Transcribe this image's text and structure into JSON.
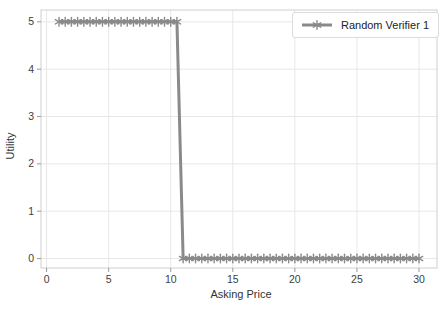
{
  "chart_data": {
    "type": "line",
    "title": "",
    "xlabel": "Asking Price",
    "ylabel": "Utility",
    "xlim": [
      -0.45,
      31.45
    ],
    "ylim": [
      -0.2,
      5.25
    ],
    "xticks": [
      0,
      5,
      10,
      15,
      20,
      25,
      30
    ],
    "yticks": [
      0,
      1,
      2,
      3,
      4,
      5
    ],
    "grid": true,
    "legend": {
      "position": "upper-right"
    },
    "series": [
      {
        "name": "Random Verifier 1",
        "color": "#8a8a8a",
        "marker": "star",
        "x": [
          1,
          1.5,
          2,
          2.5,
          3,
          3.5,
          4,
          4.5,
          5,
          5.5,
          6,
          6.5,
          7,
          7.5,
          8,
          8.5,
          9,
          9.5,
          10,
          10.5,
          11,
          11.5,
          12,
          12.5,
          13,
          13.5,
          14,
          14.5,
          15,
          15.5,
          16,
          16.5,
          17,
          17.5,
          18,
          18.5,
          19,
          19.5,
          20,
          20.5,
          21,
          21.5,
          22,
          22.5,
          23,
          23.5,
          24,
          24.5,
          25,
          25.5,
          26,
          26.5,
          27,
          27.5,
          28,
          28.5,
          29,
          29.5,
          30
        ],
        "y": [
          5,
          5,
          5,
          5,
          5,
          5,
          5,
          5,
          5,
          5,
          5,
          5,
          5,
          5,
          5,
          5,
          5,
          5,
          5,
          5,
          0,
          0,
          0,
          0,
          0,
          0,
          0,
          0,
          0,
          0,
          0,
          0,
          0,
          0,
          0,
          0,
          0,
          0,
          0,
          0,
          0,
          0,
          0,
          0,
          0,
          0,
          0,
          0,
          0,
          0,
          0,
          0,
          0,
          0,
          0,
          0,
          0,
          0,
          0
        ]
      }
    ]
  },
  "colors": {
    "background": "#ffffff",
    "grid": "#e7e7e7",
    "spine": "#cfcfcf",
    "tick": "#9a9a9a",
    "tick_label": "#3d3d3d",
    "axis_label": "#333333",
    "legend_border": "#dcdcdc"
  }
}
